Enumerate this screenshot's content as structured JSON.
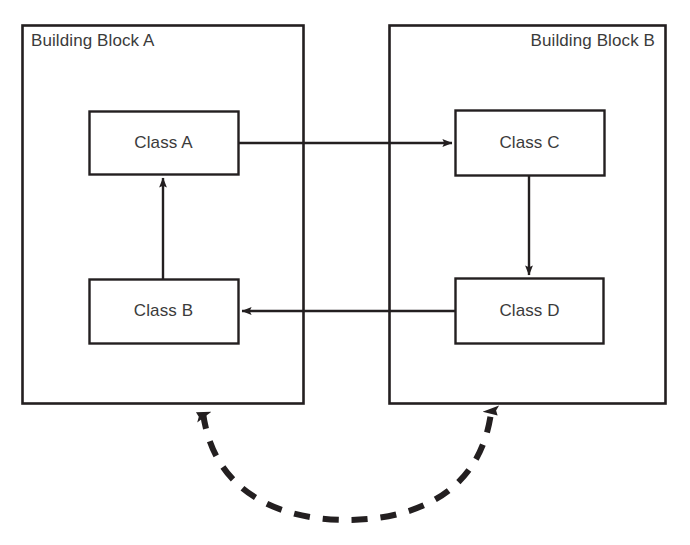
{
  "diagram": {
    "type": "block-class-dependency-diagram",
    "canvas": {
      "width": 690,
      "height": 545,
      "background": "#ffffff"
    },
    "stroke_color": "#231f20",
    "text_color": "#3b3b3b",
    "blocks": [
      {
        "id": "block-a",
        "label": "Building Block A",
        "label_align": "left",
        "x": 22,
        "y": 25,
        "width": 281,
        "height": 378
      },
      {
        "id": "block-b",
        "label": "Building Block B",
        "label_align": "right",
        "x": 389,
        "y": 25,
        "width": 276,
        "height": 378
      }
    ],
    "classes": [
      {
        "id": "class-a",
        "label": "Class A",
        "parent": "block-a",
        "x": 89,
        "y": 111,
        "width": 149,
        "height": 63
      },
      {
        "id": "class-b",
        "label": "Class B",
        "parent": "block-a",
        "x": 89,
        "y": 279,
        "width": 149,
        "height": 64
      },
      {
        "id": "class-c",
        "label": "Class C",
        "parent": "block-b",
        "x": 455,
        "y": 110,
        "width": 149,
        "height": 65
      },
      {
        "id": "class-d",
        "label": "Class D",
        "parent": "block-b",
        "x": 455,
        "y": 278,
        "width": 148,
        "height": 65
      }
    ],
    "connections": [
      {
        "id": "arrow-class-a-to-class-c",
        "from": "class-a",
        "to": "class-c",
        "style": "solid",
        "arrowheads": "end",
        "orientation": "horizontal",
        "path": "M 238 143 L 452 143"
      },
      {
        "id": "arrow-class-c-to-class-d",
        "from": "class-c",
        "to": "class-d",
        "style": "solid",
        "arrowheads": "end",
        "orientation": "vertical",
        "path": "M 529 176 L 529 275"
      },
      {
        "id": "arrow-class-d-to-class-b",
        "from": "class-d",
        "to": "class-b",
        "style": "solid",
        "arrowheads": "end",
        "orientation": "horizontal",
        "path": "M 455 311 L 242 311"
      },
      {
        "id": "arrow-class-b-to-class-a",
        "from": "class-b",
        "to": "class-a",
        "style": "solid",
        "arrowheads": "end",
        "orientation": "vertical",
        "path": "M 163 279 L 163 178"
      },
      {
        "id": "arrow-block-a-to-block-b-dashed",
        "from": "block-b",
        "to": "block-a",
        "style": "dashed",
        "arrowheads": "both",
        "orientation": "curved",
        "path": "M 203 413 C 215 500, 290 520, 347 520 C 404 520, 479 500, 491 413"
      }
    ]
  }
}
